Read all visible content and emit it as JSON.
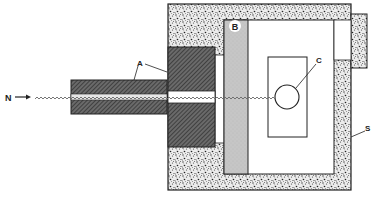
{
  "diagram": {
    "type": "neutron irradiation apparatus cross-section",
    "labels": {
      "beam": "N",
      "collimator": "A",
      "filter": "B",
      "sample": "C",
      "shield": "S"
    },
    "components": [
      {
        "id": "N",
        "description": "incoming neutron beam (arrow + wavy line)"
      },
      {
        "id": "A",
        "description": "hatched collimator (tube and block)"
      },
      {
        "id": "B",
        "description": "grey slab / filter inside shielding"
      },
      {
        "id": "C",
        "description": "circular sample in rectangular holder"
      },
      {
        "id": "S",
        "description": "stippled shielding enclosure"
      }
    ],
    "colors": {
      "hatch": "#555555",
      "stipple_bg": "#e8e8e8",
      "filter": "#c4c4c4",
      "outline": "#222222",
      "beam": "#777777"
    }
  }
}
